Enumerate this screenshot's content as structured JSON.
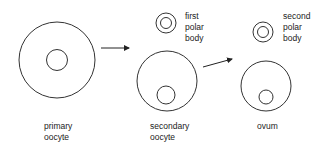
{
  "diagram": {
    "stroke_color": "#333333",
    "cells": [
      {
        "id": "primary-oocyte",
        "label_lines": [
          "primary",
          "oocyte"
        ]
      },
      {
        "id": "first-polar-body",
        "label_lines": [
          "first",
          "polar",
          "body"
        ]
      },
      {
        "id": "secondary-oocyte",
        "label_lines": [
          "secondary",
          "oocyte"
        ]
      },
      {
        "id": "second-polar-body",
        "label_lines": [
          "second",
          "polar",
          "body"
        ]
      },
      {
        "id": "ovum",
        "label_lines": [
          "ovum"
        ]
      }
    ]
  }
}
